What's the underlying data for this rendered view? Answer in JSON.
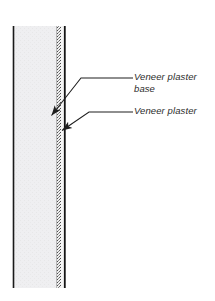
{
  "figure": {
    "type": "architectural-wall-section-detail",
    "background_color": "#ffffff",
    "width": 215,
    "height": 301
  },
  "wall_section": {
    "top_y": 26,
    "bottom_y": 288,
    "layers": [
      {
        "name": "substrate-field",
        "description": "wide light gray hatched backing field",
        "x_start": 13,
        "x_end": 57,
        "fill_color": "#ececed",
        "edge_color": "#1a1a1a"
      },
      {
        "name": "veneer-plaster-base-layer",
        "description": "narrow stippled band",
        "x_start": 57,
        "x_end": 61,
        "fill_color": "#b8b8b8"
      },
      {
        "name": "veneer-plaster-layer",
        "description": "thin finish coat at face",
        "x_start": 61,
        "x_end": 64,
        "fill_color": "#f4f4f4"
      },
      {
        "name": "face-line",
        "description": "right hand black boundary line",
        "x_start": 64,
        "x_end": 66,
        "fill_color": "#151515"
      }
    ]
  },
  "callouts": [
    {
      "id": "veneer-plaster-base",
      "label": "Veneer plaster\nbase",
      "text_color": "#2b2b2b",
      "leader": {
        "arrow_tip": [
          49,
          118
        ],
        "elbow": [
          81,
          78
        ],
        "end": [
          133,
          78
        ],
        "color": "#1f1f1f"
      }
    },
    {
      "id": "veneer-plaster",
      "label": "Veneer plaster",
      "text_color": "#2b2b2b",
      "leader": {
        "arrow_tip": [
          60,
          133
        ],
        "elbow": [
          89,
          112
        ],
        "end": [
          133,
          112
        ],
        "color": "#1f1f1f"
      }
    }
  ]
}
